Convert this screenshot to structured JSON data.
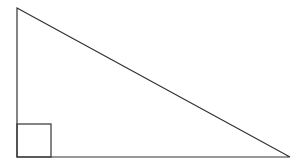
{
  "diagram": {
    "type": "right-triangle",
    "stroke_color": "#333333",
    "background": "#ffffff",
    "vertices": {
      "top": [
        17,
        8
      ],
      "bottom_left": [
        17,
        157
      ],
      "bottom_right": [
        290,
        157
      ]
    },
    "right_angle_marker": {
      "x": 17,
      "y": 124,
      "size": 34,
      "corner": "bottom_left"
    }
  }
}
